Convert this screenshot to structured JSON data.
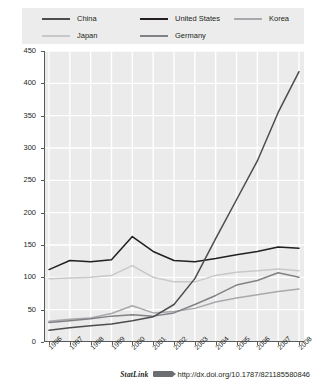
{
  "chart_data": {
    "type": "line",
    "title": "",
    "xlabel": "",
    "ylabel": "",
    "categories": [
      "1996",
      "1997",
      "1998",
      "1999",
      "2000",
      "2001",
      "2002",
      "2003",
      "2004",
      "2005",
      "2006",
      "2007",
      "2008"
    ],
    "x": [
      1996,
      1997,
      1998,
      1999,
      2000,
      2001,
      2002,
      2003,
      2004,
      2005,
      2006,
      2007,
      2008
    ],
    "ylim": [
      0,
      450
    ],
    "ytick_step": 50,
    "yticks": [
      0,
      50,
      100,
      150,
      200,
      250,
      300,
      350,
      400,
      450
    ],
    "grid": true,
    "legend_position": "top",
    "series": [
      {
        "name": "China",
        "color": "#4d4d4f",
        "values": [
          18,
          22,
          25,
          28,
          33,
          39,
          58,
          98,
          160,
          220,
          280,
          355,
          418
        ]
      },
      {
        "name": "United States",
        "color": "#231f20",
        "values": [
          112,
          126,
          124,
          127,
          163,
          140,
          126,
          124,
          129,
          135,
          140,
          147,
          145
        ]
      },
      {
        "name": "Korea",
        "color": "#a7a9ac",
        "values": [
          32,
          35,
          37,
          44,
          56,
          45,
          47,
          52,
          62,
          68,
          73,
          78,
          82
        ]
      },
      {
        "name": "Japan",
        "color": "#c7c8ca",
        "values": [
          98,
          99,
          100,
          103,
          118,
          100,
          93,
          93,
          103,
          108,
          110,
          113,
          110
        ]
      },
      {
        "name": "Germany",
        "color": "#808285",
        "values": [
          30,
          33,
          36,
          40,
          42,
          40,
          45,
          58,
          72,
          88,
          95,
          107,
          100
        ]
      }
    ]
  },
  "legend": {
    "items": [
      {
        "label": "China",
        "color": "#4d4d4f"
      },
      {
        "label": "United States",
        "color": "#231f20"
      },
      {
        "label": "Korea",
        "color": "#a7a9ac"
      },
      {
        "label": "Japan",
        "color": "#c7c8ca"
      },
      {
        "label": "Germany",
        "color": "#808285"
      }
    ]
  },
  "footer": {
    "statlink_label": "StatLink",
    "url": "http://dx.doi.org/10.1787/821185580846"
  }
}
